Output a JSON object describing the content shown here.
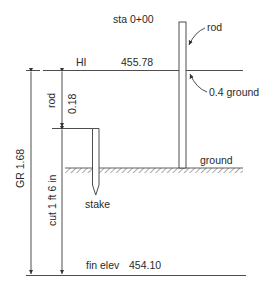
{
  "diagram": {
    "title": "sta 0+00",
    "hi": {
      "label": "HI",
      "value": "455.78"
    },
    "rod_callout": "rod",
    "ground_reading_callout": "0.4 ground",
    "ground_label": "ground",
    "stake_label": "stake",
    "rod_dimension": {
      "label": "rod",
      "value": "0.18"
    },
    "gr_dimension": "GR 1.68",
    "cut_dimension": "cut 1 ft 6 in",
    "finish_elevation": {
      "label": "fin elev",
      "value": "454.10"
    },
    "colors": {
      "line": "#3a3a3a",
      "text": "#2a2a2a",
      "hatch": "#555555"
    }
  }
}
